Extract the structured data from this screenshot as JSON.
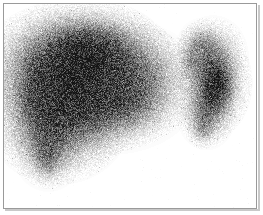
{
  "image": {
    "kind": "nuclear-medicine-scintigram",
    "modality": "Scintigraphy",
    "study": "Liver-spleen colloid scan",
    "view": "Anterior",
    "colormap": "grayscale-inverted",
    "width": 263,
    "height": 215,
    "background_color": "#ffffff",
    "frame_color": "#9a9a9a",
    "frame_shadow_color": "#c9c9c9",
    "frame": {
      "x": 3,
      "y": 3,
      "width": 254,
      "height": 206,
      "border_width": 1
    },
    "alt_text": "Grayscale nuclear medicine scintigram showing a large speckled liver shadow occupying the left and central field and a smaller crescent-shaped spleen with a dark core at the right.",
    "noise": {
      "type": "poisson-speckle",
      "grain_px": 1,
      "amplitude": 0.3,
      "seed": 20240117
    },
    "regions": [
      {
        "name": "liver",
        "label": "Liver",
        "peak_intensity": 0.62,
        "centroid": {
          "x": 92,
          "y": 92
        },
        "blobs": [
          {
            "x": 72,
            "y": 62,
            "rx": 52,
            "ry": 34,
            "a": 0.6,
            "rot": -6
          },
          {
            "x": 64,
            "y": 88,
            "rx": 46,
            "ry": 44,
            "a": 0.62,
            "rot": 0
          },
          {
            "x": 96,
            "y": 56,
            "rx": 44,
            "ry": 27,
            "a": 0.5,
            "rot": 4
          },
          {
            "x": 110,
            "y": 86,
            "rx": 48,
            "ry": 36,
            "a": 0.44,
            "rot": 0
          },
          {
            "x": 140,
            "y": 80,
            "rx": 32,
            "ry": 30,
            "a": 0.33,
            "rot": 0
          },
          {
            "x": 58,
            "y": 120,
            "rx": 38,
            "ry": 34,
            "a": 0.52,
            "rot": 0
          },
          {
            "x": 48,
            "y": 146,
            "rx": 20,
            "ry": 24,
            "a": 0.4,
            "rot": 0
          },
          {
            "x": 47,
            "y": 160,
            "rx": 10,
            "ry": 13,
            "a": 0.3,
            "rot": 0
          },
          {
            "x": 96,
            "y": 112,
            "rx": 40,
            "ry": 22,
            "a": 0.4,
            "rot": 0
          },
          {
            "x": 128,
            "y": 104,
            "rx": 26,
            "ry": 18,
            "a": 0.28,
            "rot": 0
          },
          {
            "x": 86,
            "y": 40,
            "rx": 34,
            "ry": 16,
            "a": 0.34,
            "rot": 0
          },
          {
            "x": 34,
            "y": 92,
            "rx": 16,
            "ry": 36,
            "a": 0.36,
            "rot": 0
          }
        ]
      },
      {
        "name": "spleen",
        "label": "Spleen",
        "peak_intensity": 0.66,
        "centroid": {
          "x": 212,
          "y": 84
        },
        "blobs": [
          {
            "x": 210,
            "y": 60,
            "rx": 20,
            "ry": 24,
            "a": 0.46,
            "rot": 12
          },
          {
            "x": 214,
            "y": 86,
            "rx": 20,
            "ry": 28,
            "a": 0.6,
            "rot": 6
          },
          {
            "x": 216,
            "y": 86,
            "rx": 12,
            "ry": 19,
            "a": 0.66,
            "rot": 0
          },
          {
            "x": 206,
            "y": 112,
            "rx": 16,
            "ry": 20,
            "a": 0.44,
            "rot": 0
          },
          {
            "x": 202,
            "y": 128,
            "rx": 9,
            "ry": 11,
            "a": 0.26,
            "rot": 0
          },
          {
            "x": 201,
            "y": 44,
            "rx": 13,
            "ry": 14,
            "a": 0.3,
            "rot": 0
          },
          {
            "x": 190,
            "y": 60,
            "rx": 10,
            "ry": 18,
            "a": 0.2,
            "rot": 0
          }
        ]
      },
      {
        "name": "inter-organ-gap",
        "label": "Photopenic gap",
        "peak_intensity": 0.05,
        "centroid": {
          "x": 176,
          "y": 96
        },
        "blobs": []
      }
    ]
  }
}
